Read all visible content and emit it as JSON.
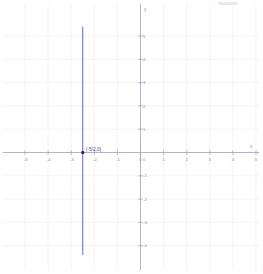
{
  "chart_data": {
    "type": "line",
    "title": "",
    "xlabel": "x",
    "ylabel": "y",
    "xlim": [
      -5.6,
      5.4
    ],
    "ylim": [
      -4.4,
      5.4
    ],
    "grid": true,
    "grid_step": 1,
    "legend": "none",
    "x_ticks": [
      "-5",
      "-4",
      "-3",
      "-2",
      "-1",
      "0",
      "1",
      "2",
      "3",
      "4",
      "5"
    ],
    "x_tick_values": [
      -5,
      -4,
      -3,
      -2,
      -1,
      0,
      1,
      2,
      3,
      4,
      5
    ],
    "y_ticks": [
      "5",
      "4",
      "3",
      "2",
      "1",
      "0",
      "-1",
      "-2",
      "-3",
      "-4"
    ],
    "y_tick_values": [
      5,
      4,
      3,
      2,
      1,
      0,
      -1,
      -2,
      -3,
      -4
    ],
    "series": [
      {
        "name": "vertical-line",
        "equation": "x = -5/2",
        "type": "vertical-line",
        "x": -2.5,
        "y_from": -4.4,
        "y_to": 5.4,
        "color": "#6a6ab4"
      }
    ],
    "annotations": [
      {
        "label": "(-5/2,0)",
        "x": -2.5,
        "y": 0,
        "marker": "filled-dot",
        "color": "#4a4a9c"
      }
    ]
  },
  "axes": {
    "x_axis_name": "x",
    "y_axis_name": "y",
    "origin_label": "0"
  },
  "colors": {
    "grid": "#ececf2",
    "axis": "#9a9aa8",
    "data": "#6a6ab4",
    "point": "#2b2b5e",
    "label_text": "#4a4a9c",
    "tick_text": "#8a8a9a",
    "background": "#ffffff"
  }
}
